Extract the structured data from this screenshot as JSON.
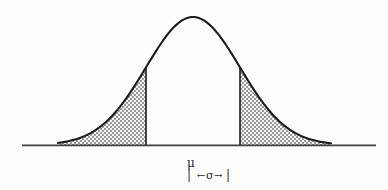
{
  "figure": {
    "background_color": "#fdfdfc",
    "curve_color": "#1c1c1c",
    "axis_color": "#3a3a3a",
    "shade_color": "#8d8d8d",
    "shade_fill_light": "#e2e2e2"
  },
  "labels": {
    "mean_symbol": "μ",
    "sigma_symbol": "σ",
    "arrow_left": "←",
    "arrow_right": "→",
    "tick_left": "|",
    "tick_right": "|"
  },
  "chart_data": {
    "type": "line",
    "title": "",
    "xlabel": "",
    "ylabel": "",
    "subtitle": "",
    "grid": false,
    "legend": "none",
    "axis": {
      "baseline_y_px": 145,
      "x_start_px": 22,
      "x_end_px": 376
    },
    "curve": {
      "kind": "gaussian",
      "mean_px": 193,
      "sigma_px": 47,
      "peak_y_px": 17,
      "left_tail_px": 58,
      "right_tail_px": 331
    },
    "shaded_regions": [
      {
        "name": "left-shaded-region",
        "from_px": 58,
        "to_px": 146,
        "description": "area under curve left of mu minus one sigma"
      },
      {
        "name": "right-shaded-region",
        "from_px": 240,
        "to_px": 331,
        "description": "area under curve right of mu plus one sigma"
      }
    ],
    "boundaries": [
      {
        "name": "left-sigma-boundary",
        "x_px": 146
      },
      {
        "name": "right-sigma-boundary",
        "x_px": 240
      }
    ],
    "annotations": [
      {
        "name": "mean-annotation",
        "text": "μ",
        "x_px": 191,
        "y_px": 163
      },
      {
        "name": "sigma-span-annotation",
        "text": "| ←σ→ |",
        "x_px": 196,
        "y_px": 176
      }
    ]
  }
}
